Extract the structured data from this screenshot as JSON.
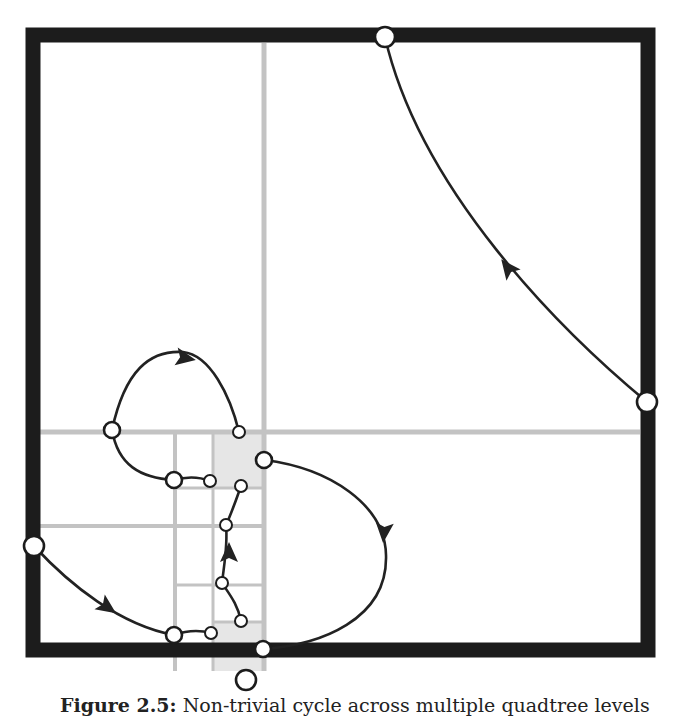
{
  "figure": {
    "caption_label": "Figure 2.5:",
    "caption_text": "Non-trivial cycle across multiple quadtree levels",
    "colors": {
      "frame": "#1c1c1c",
      "grid": "#c3c3c3",
      "shaded": "#e6e6e6",
      "curve": "#222222",
      "node_fill": "#ffffff",
      "node_stroke": "#1c1c1c"
    },
    "frame": {
      "x": 33,
      "y": 35,
      "size": 615,
      "stroke_width": 15
    },
    "grid_lines": [
      {
        "id": "v-main",
        "x1": 264,
        "y1": 43,
        "x2": 264,
        "y2": 671,
        "w": 5
      },
      {
        "id": "h-main",
        "x1": 40,
        "y1": 432,
        "x2": 640,
        "y2": 432,
        "w": 5
      },
      {
        "id": "v-level2-a",
        "x1": 175,
        "y1": 432,
        "x2": 175,
        "y2": 671,
        "w": 4
      },
      {
        "id": "h-level2-a",
        "x1": 40,
        "y1": 526,
        "x2": 264,
        "y2": 526,
        "w": 4
      },
      {
        "id": "v-level3-a",
        "x1": 213,
        "y1": 432,
        "x2": 213,
        "y2": 671,
        "w": 3
      },
      {
        "id": "h-level3-a",
        "x1": 175,
        "y1": 488,
        "x2": 264,
        "y2": 488,
        "w": 3
      },
      {
        "id": "h-level3-b",
        "x1": 175,
        "y1": 585,
        "x2": 264,
        "y2": 585,
        "w": 3
      },
      {
        "id": "h-level3-c",
        "x1": 213,
        "y1": 622,
        "x2": 264,
        "y2": 622,
        "w": 3
      }
    ],
    "shaded_cells": [
      {
        "x": 213,
        "y": 434,
        "w": 49,
        "h": 54
      },
      {
        "x": 213,
        "y": 622,
        "w": 49,
        "h": 49
      }
    ],
    "curves": [
      {
        "id": "curve-top-right",
        "d": "M 647 402 C 560 330, 420 190, 385 37"
      },
      {
        "id": "curve-upper-loop",
        "d": "M 112 430 C 125 370, 150 350, 183 352 C 210 355, 230 395, 239 432"
      },
      {
        "id": "curve-left-link",
        "d": "M 112 430 C 118 465, 140 478, 174 480"
      },
      {
        "id": "curve-small-a",
        "d": "M 174 480 C 188 476, 200 477, 210 481"
      },
      {
        "id": "curve-small-b",
        "d": "M 241 486 C 236 500, 232 512, 226 525"
      },
      {
        "id": "curve-center-up",
        "d": "M 222 583 C 224 565, 228 545, 226 525"
      },
      {
        "id": "curve-center-low",
        "d": "M 222 583 C 230 595, 238 605, 241 621"
      },
      {
        "id": "curve-right-loop",
        "d": "M 264 460 C 330 468, 385 505, 386 555 C 388 620, 320 645, 263 649"
      },
      {
        "id": "curve-bottom-left",
        "d": "M 34 546 C 70 585, 120 625, 174 635"
      },
      {
        "id": "curve-small-c",
        "d": "M 174 635 C 188 630, 200 630, 211 633"
      }
    ],
    "arrows": [
      {
        "id": "arrow-top-right",
        "x": 508,
        "y": 268,
        "angle": -128
      },
      {
        "id": "arrow-upper-loop",
        "x": 185,
        "y": 358,
        "angle": 10
      },
      {
        "id": "arrow-center",
        "x": 229,
        "y": 553,
        "angle": -90
      },
      {
        "id": "arrow-right-loop",
        "x": 384,
        "y": 532,
        "angle": 95
      },
      {
        "id": "arrow-bottom-left",
        "x": 107,
        "y": 607,
        "angle": 35
      }
    ],
    "nodes": [
      {
        "id": "node-top",
        "cx": 385,
        "cy": 37,
        "r": 10,
        "size": "large"
      },
      {
        "id": "node-right",
        "cx": 647,
        "cy": 402,
        "r": 10,
        "size": "large"
      },
      {
        "id": "node-left",
        "cx": 34,
        "cy": 546,
        "r": 10,
        "size": "large"
      },
      {
        "id": "node-bottom",
        "cx": 246,
        "cy": 680,
        "r": 10,
        "size": "large"
      },
      {
        "id": "node-mid-left",
        "cx": 112,
        "cy": 430,
        "r": 8,
        "size": "large"
      },
      {
        "id": "node-upper-small",
        "cx": 239,
        "cy": 432,
        "r": 6,
        "size": "small"
      },
      {
        "id": "node-a-large",
        "cx": 174,
        "cy": 480,
        "r": 8,
        "size": "large"
      },
      {
        "id": "node-a-small",
        "cx": 210,
        "cy": 481,
        "r": 6,
        "size": "small"
      },
      {
        "id": "node-b-small",
        "cx": 241,
        "cy": 486,
        "r": 6,
        "size": "small"
      },
      {
        "id": "node-right-upper",
        "cx": 264,
        "cy": 460,
        "r": 8,
        "size": "large"
      },
      {
        "id": "node-c-small",
        "cx": 226,
        "cy": 525,
        "r": 6,
        "size": "small"
      },
      {
        "id": "node-d-small",
        "cx": 222,
        "cy": 583,
        "r": 6,
        "size": "small"
      },
      {
        "id": "node-e-small",
        "cx": 241,
        "cy": 621,
        "r": 6,
        "size": "small"
      },
      {
        "id": "node-f-large",
        "cx": 174,
        "cy": 635,
        "r": 8,
        "size": "large"
      },
      {
        "id": "node-f-small",
        "cx": 211,
        "cy": 633,
        "r": 6,
        "size": "small"
      },
      {
        "id": "node-right-lower",
        "cx": 263,
        "cy": 649,
        "r": 8,
        "size": "large"
      }
    ]
  }
}
